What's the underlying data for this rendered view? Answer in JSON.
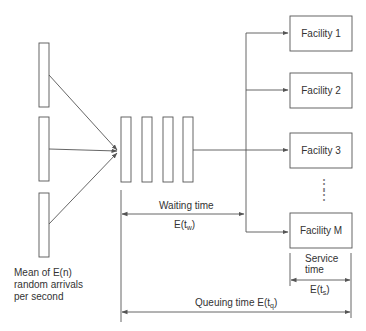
{
  "diagram": {
    "type": "queuing-system",
    "sources": {
      "count": 3,
      "label_lines": [
        "Mean of E(n)",
        "random arrivals",
        "per second"
      ]
    },
    "queue": {
      "slots": 4
    },
    "facilities": [
      {
        "label": "Facility 1"
      },
      {
        "label": "Facility 2"
      },
      {
        "label": "Facility 3"
      },
      {
        "label": "Facility M"
      }
    ],
    "ellipsis": "⋮",
    "waiting_time": {
      "label": "Waiting time",
      "expr_prefix": "E(t",
      "expr_sub": "w",
      "expr_suffix": ")"
    },
    "service_time": {
      "label_line1": "Service",
      "label_line2": "time",
      "expr_prefix": "E(t",
      "expr_sub": "s",
      "expr_suffix": ")"
    },
    "queuing_time": {
      "label": "Queuing time E(t",
      "expr_sub": "q",
      "expr_suffix": ")"
    },
    "colors": {
      "line": "#555555",
      "text": "#333333"
    }
  }
}
